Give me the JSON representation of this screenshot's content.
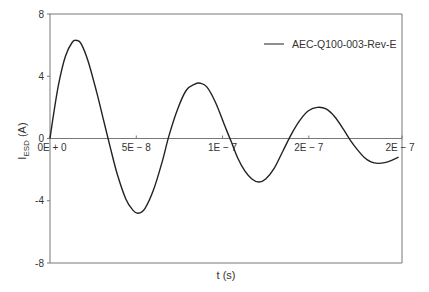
{
  "chart_data": {
    "type": "line",
    "title": "",
    "xlabel": "t (s)",
    "ylabel_main": "I",
    "ylabel_sub": "ESD",
    "ylabel_unit": " (A)",
    "xlim": [
      0,
      2.04e-07
    ],
    "ylim": [
      -8,
      8
    ],
    "grid": false,
    "legend_position": "top-right",
    "x_ticks": [
      {
        "value": 0,
        "label": "0E + 0"
      },
      {
        "value": 5e-08,
        "label": "5E − 8"
      },
      {
        "value": 1e-07,
        "label": "1E − 7"
      },
      {
        "value": 1.5e-07,
        "label": "2E − 7"
      },
      {
        "value": 2.04e-07,
        "label": "2E − 7"
      }
    ],
    "y_ticks": [
      {
        "value": 8,
        "label": "8"
      },
      {
        "value": 4,
        "label": "4"
      },
      {
        "value": 0,
        "label": "0"
      },
      {
        "value": -4,
        "label": "-4"
      },
      {
        "value": -8,
        "label": "-8"
      }
    ],
    "series": [
      {
        "name": "AEC-Q100-003-Rev-E",
        "color": "#222222",
        "x": [
          0,
          2e-09,
          5e-09,
          9e-09,
          1.3e-08,
          1.55e-08,
          1.8e-08,
          2.2e-08,
          2.7e-08,
          3.1e-08,
          3.5e-08,
          3.9e-08,
          4.4e-08,
          4.8e-08,
          5.1e-08,
          5.5e-08,
          6e-08,
          6.5e-08,
          6.9e-08,
          7.4e-08,
          7.9e-08,
          8.4e-08,
          8.7e-08,
          9.1e-08,
          9.6e-08,
          1.01e-07,
          1.05e-07,
          1.09e-07,
          1.13e-07,
          1.17e-07,
          1.21e-07,
          1.25e-07,
          1.3e-07,
          1.35e-07,
          1.4e-07,
          1.45e-07,
          1.5e-07,
          1.55e-07,
          1.6e-07,
          1.65e-07,
          1.7e-07,
          1.74e-07,
          1.78e-07,
          1.82e-07,
          1.86e-07,
          1.9e-07,
          1.94e-07,
          1.98e-07,
          2.02e-07
        ],
        "y": [
          0,
          1.5,
          3.5,
          5.3,
          6.2,
          6.3,
          6.1,
          5.0,
          3.0,
          1.2,
          -0.6,
          -2.3,
          -3.9,
          -4.6,
          -4.8,
          -4.5,
          -3.3,
          -1.5,
          0.2,
          1.9,
          3.1,
          3.5,
          3.55,
          3.3,
          2.3,
          0.9,
          -0.2,
          -1.3,
          -2.1,
          -2.6,
          -2.8,
          -2.6,
          -1.9,
          -0.8,
          0.3,
          1.2,
          1.8,
          2.0,
          1.9,
          1.4,
          0.6,
          -0.1,
          -0.7,
          -1.2,
          -1.5,
          -1.6,
          -1.55,
          -1.4,
          -1.2
        ]
      }
    ]
  }
}
